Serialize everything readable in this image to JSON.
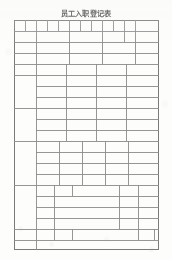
{
  "document": {
    "title": "员工入职登记表",
    "title_pinyin_note": "Employee Onboarding Registration Form",
    "kind": "scanned-blank-form",
    "paper_color": "#fdfdfc",
    "line_color": "#8b8b8b",
    "text_color": "#4a4a4a",
    "page": {
      "width": 172,
      "height": 260
    }
  },
  "table": {
    "name": "employee-onboarding-grid",
    "origin": {
      "x": 14,
      "y": 20
    },
    "size": {
      "width": 145,
      "height": 230
    },
    "all_cells_blank": true,
    "columns_note": "widths are fractions of table width",
    "horizontal_rules_y": [
      0,
      11,
      22,
      33,
      44,
      55,
      66,
      77,
      88,
      99,
      110,
      121,
      132,
      143,
      154,
      165,
      176,
      187,
      198,
      209,
      220,
      230
    ],
    "sections": [
      {
        "id": "section-identity",
        "label_column_width": 0,
        "rows": [
          {
            "id": "row-1-fields",
            "y": 0,
            "h": 11,
            "dividers_x": [
              11,
              22,
              33,
              44,
              55,
              66,
              77,
              88,
              99,
              110,
              121
            ],
            "photo_cell_from_x": 121
          },
          {
            "id": "row-2-fields",
            "y": 11,
            "h": 11,
            "dividers_x": [
              22,
              55,
              88,
              110,
              121
            ],
            "photo_cell_from_x": 121
          },
          {
            "id": "row-3-fields",
            "y": 22,
            "h": 11,
            "dividers_x": [
              22,
              55,
              88,
              110,
              121
            ],
            "photo_cell_from_x": 121
          },
          {
            "id": "row-4-fields",
            "y": 33,
            "h": 11,
            "dividers_x": [
              22,
              55,
              88,
              121
            ],
            "photo_cell_from_x": 121
          }
        ],
        "photo_cell": {
          "id": "photo-cell",
          "x": 121,
          "y": 0,
          "w": 24,
          "h": 44
        }
      },
      {
        "id": "section-education",
        "label_cell": {
          "x": 0,
          "y": 44,
          "w": 22,
          "h": 44
        },
        "rows": [
          {
            "id": "edu-row-1",
            "y": 44,
            "h": 11,
            "dividers_x": [
              22,
              52,
              82,
              112
            ]
          },
          {
            "id": "edu-row-2",
            "y": 55,
            "h": 11,
            "dividers_x": [
              22,
              52,
              82,
              112
            ]
          },
          {
            "id": "edu-row-3",
            "y": 66,
            "h": 11,
            "dividers_x": [
              22,
              52,
              82,
              112
            ]
          },
          {
            "id": "edu-row-4",
            "y": 77,
            "h": 11,
            "dividers_x": [
              22,
              52,
              82,
              112
            ]
          }
        ]
      },
      {
        "id": "section-family",
        "label_cell": {
          "x": 0,
          "y": 88,
          "w": 22,
          "h": 33
        },
        "rows": [
          {
            "id": "fam-row-1",
            "y": 88,
            "h": 11,
            "dividers_x": [
              22,
              52,
              82,
              112
            ]
          },
          {
            "id": "fam-row-2",
            "y": 99,
            "h": 11,
            "dividers_x": [
              22,
              52,
              82,
              112
            ]
          },
          {
            "id": "fam-row-3",
            "y": 110,
            "h": 11,
            "dividers_x": [
              22,
              52,
              82,
              112
            ]
          }
        ]
      },
      {
        "id": "section-work-history",
        "label_cell": {
          "x": 0,
          "y": 121,
          "w": 22,
          "h": 44
        },
        "header_row": {
          "id": "work-header",
          "y": 121,
          "h": 11,
          "dividers_x": [
            22,
            45,
            68,
            91,
            114
          ]
        },
        "rows": [
          {
            "id": "work-row-1",
            "y": 132,
            "h": 11,
            "dividers_x": [
              22,
              45,
              68,
              91,
              114
            ]
          },
          {
            "id": "work-row-2",
            "y": 143,
            "h": 11,
            "dividers_x": [
              22,
              45,
              68,
              91,
              114
            ]
          },
          {
            "id": "work-row-3",
            "y": 154,
            "h": 11,
            "dividers_x": [
              22,
              45,
              68,
              91,
              114
            ]
          }
        ]
      },
      {
        "id": "section-emergency",
        "label_cell": {
          "x": 0,
          "y": 165,
          "w": 22,
          "h": 44
        },
        "header_row": {
          "id": "emg-header",
          "y": 165,
          "h": 11,
          "dividers_x": [
            22,
            40,
            58,
            105,
            124
          ]
        },
        "rows": [
          {
            "id": "emg-row-1",
            "y": 176,
            "h": 11,
            "dividers_x": [
              22,
              40,
              105,
              124
            ]
          },
          {
            "id": "emg-row-2",
            "y": 187,
            "h": 11,
            "dividers_x": [
              22,
              40,
              105,
              124
            ]
          },
          {
            "id": "emg-row-3",
            "y": 198,
            "h": 11,
            "dividers_x": [
              22,
              40,
              105,
              124
            ]
          }
        ]
      },
      {
        "id": "section-declaration",
        "rows": [
          {
            "id": "decl-header",
            "y": 209,
            "h": 11,
            "dividers_x": [
              22,
              40,
              58,
              124,
              140
            ]
          },
          {
            "id": "decl-row-1",
            "y": 220,
            "h": 11,
            "dividers_x": [
              22
            ]
          },
          {
            "id": "decl-row-2",
            "y": 231,
            "h": 11,
            "dividers_x": [
              22
            ]
          }
        ]
      }
    ]
  }
}
